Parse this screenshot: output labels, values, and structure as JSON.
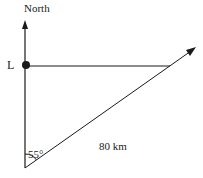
{
  "labels": {
    "north": "North",
    "point": "L",
    "distance": "80 km",
    "angle": "55°"
  },
  "geometry": {
    "origin": [
      25,
      168
    ],
    "north_arrow_tip": [
      25,
      22
    ],
    "point_l": [
      26,
      65
    ],
    "horizontal_end": [
      170,
      66
    ],
    "bearing_arrow_tip": [
      195,
      48
    ]
  },
  "colors": {
    "line": "#1a1a1a",
    "background": "#ffffff"
  }
}
